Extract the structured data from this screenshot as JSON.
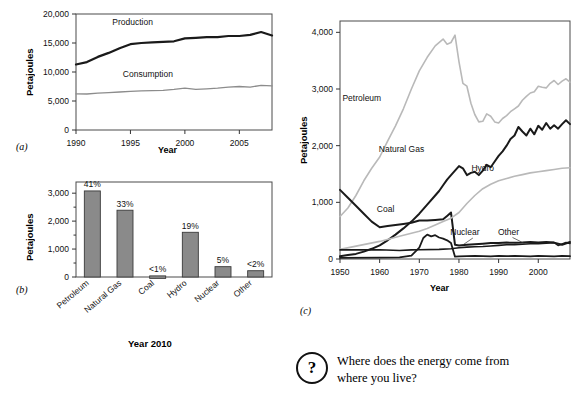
{
  "figure": {
    "panel_a_tag": "(a)",
    "panel_b_tag": "(b)",
    "panel_c_tag": "(c)",
    "bar_caption": "Year 2010",
    "colors": {
      "dark_series": "#1a1a1a",
      "light_series": "#b3b3b3",
      "bar_fill": "#8a8a8a",
      "bar_stroke": "#3a3a3a",
      "frame": "#4a4a4a",
      "text": "#111111"
    }
  },
  "question": {
    "badge": "?",
    "text": "Where does the energy come from where you live?"
  },
  "chart_data": [
    {
      "id": "panel-a",
      "type": "line",
      "title": "",
      "xlabel": "Year",
      "ylabel": "Petajoules",
      "xlim": [
        1990,
        2008
      ],
      "ylim": [
        0,
        20000
      ],
      "xticks": [
        1990,
        1995,
        2000,
        2005
      ],
      "xtick_labels": [
        "1990",
        "1995",
        "2000",
        "2005"
      ],
      "yticks": [
        0,
        5000,
        10000,
        15000,
        20000
      ],
      "ytick_labels": [
        "0",
        "5,000",
        "10,000",
        "15,000",
        "20,000"
      ],
      "grid": false,
      "legend": "inline-annotation",
      "x": [
        1990,
        1991,
        1992,
        1993,
        1994,
        1995,
        1996,
        1997,
        1998,
        1999,
        2000,
        2001,
        2002,
        2003,
        2004,
        2005,
        2006,
        2007,
        2008
      ],
      "series": [
        {
          "name": "Production",
          "color": "#1a1a1a",
          "width": 2.2,
          "label_x": 1995.2,
          "label_y": 18100,
          "values": [
            11300,
            11700,
            12600,
            13300,
            14100,
            14800,
            15000,
            15100,
            15200,
            15300,
            15800,
            15900,
            16000,
            16000,
            16200,
            16200,
            16400,
            16900,
            16300
          ]
        },
        {
          "name": "Consumption",
          "color": "#8c8c8c",
          "width": 1.3,
          "label_x": 1996.6,
          "label_y": 9100,
          "values": [
            6250,
            6200,
            6350,
            6450,
            6550,
            6650,
            6750,
            6800,
            6850,
            7000,
            7200,
            7000,
            7100,
            7200,
            7400,
            7500,
            7400,
            7700,
            7600
          ]
        }
      ]
    },
    {
      "id": "panel-b",
      "type": "bar",
      "title": "",
      "xlabel": "",
      "ylabel": "Petajoules",
      "ylim": [
        0,
        3400
      ],
      "yticks": [
        0,
        1000,
        2000,
        3000
      ],
      "ytick_labels": [
        "0",
        "1,000",
        "2,000",
        "3,000"
      ],
      "grid": false,
      "categories": [
        "Petroleum",
        "Natural Gas",
        "Coal",
        "Hydro",
        "Nuclear",
        "Other"
      ],
      "values": [
        3080,
        2390,
        40,
        1600,
        370,
        225
      ],
      "data_labels": [
        "41%",
        "33%",
        "<1%",
        "19%",
        "5%",
        "<2%"
      ],
      "caption": "Year 2010"
    },
    {
      "id": "panel-c",
      "type": "line",
      "title": "",
      "xlabel": "Year",
      "ylabel": "Petajoules",
      "xlim": [
        1950,
        2008
      ],
      "ylim": [
        0,
        4200
      ],
      "xticks": [
        1950,
        1960,
        1970,
        1980,
        1990,
        2000
      ],
      "xtick_labels": [
        "1950",
        "1960",
        "1970",
        "1980",
        "1990",
        "2000"
      ],
      "yticks": [
        0,
        1000,
        2000,
        3000,
        4000
      ],
      "ytick_labels": [
        "0",
        "1,000",
        "2,000",
        "3,000",
        "4,000"
      ],
      "grid": false,
      "legend": "inline-annotation",
      "series": [
        {
          "name": "Petroleum",
          "color": "#b9b9b9",
          "width": 1.6,
          "label_x": 1955.5,
          "label_y": 2780,
          "leader": null,
          "x": [
            1950,
            1952,
            1954,
            1956,
            1958,
            1960,
            1962,
            1964,
            1966,
            1968,
            1970,
            1972,
            1974,
            1976,
            1977,
            1978,
            1979,
            1980,
            1981,
            1982,
            1983,
            1984,
            1985,
            1986,
            1987,
            1988,
            1989,
            1990,
            1991,
            1992,
            1993,
            1994,
            1995,
            1996,
            1997,
            1998,
            1999,
            2000,
            2001,
            2002,
            2003,
            2004,
            2005,
            2006,
            2007,
            2008
          ],
          "values": [
            750,
            900,
            1120,
            1380,
            1600,
            1800,
            2080,
            2350,
            2650,
            3000,
            3320,
            3560,
            3760,
            3880,
            3790,
            3820,
            3950,
            3480,
            3100,
            3050,
            2750,
            2550,
            2420,
            2430,
            2560,
            2520,
            2420,
            2400,
            2480,
            2530,
            2600,
            2650,
            2700,
            2800,
            2870,
            2930,
            2950,
            3050,
            3030,
            3020,
            3100,
            3150,
            3080,
            3140,
            3180,
            3120
          ]
        },
        {
          "name": "Natural Gas",
          "color": "#1a1a1a",
          "width": 2.0,
          "label_x": 1965.5,
          "label_y": 1880,
          "leader": null,
          "x": [
            1950,
            1952,
            1954,
            1956,
            1958,
            1960,
            1962,
            1964,
            1966,
            1968,
            1970,
            1972,
            1974,
            1975,
            1976,
            1977,
            1978,
            1979,
            1980,
            1981,
            1982,
            1983,
            1984,
            1985,
            1986,
            1987,
            1988,
            1989,
            1990,
            1991,
            1992,
            1993,
            1994,
            1995,
            1996,
            1997,
            1998,
            1999,
            2000,
            2001,
            2002,
            2003,
            2004,
            2005,
            2006,
            2007,
            2008
          ],
          "values": [
            50,
            70,
            90,
            130,
            180,
            240,
            330,
            430,
            540,
            660,
            800,
            960,
            1120,
            1200,
            1300,
            1400,
            1480,
            1560,
            1640,
            1600,
            1480,
            1520,
            1540,
            1480,
            1560,
            1660,
            1620,
            1720,
            1820,
            1900,
            2000,
            2120,
            2180,
            2330,
            2250,
            2180,
            2300,
            2200,
            2350,
            2280,
            2400,
            2300,
            2360,
            2300,
            2380,
            2450,
            2380
          ]
        },
        {
          "name": "Coal",
          "color": "#1a1a1a",
          "width": 2.0,
          "label_x": 1961.5,
          "label_y": 830,
          "leader": null,
          "x": [
            1950,
            1952,
            1954,
            1956,
            1958,
            1960,
            1962,
            1964,
            1966,
            1968,
            1970,
            1972,
            1974,
            1976,
            1977,
            1978,
            1979,
            1980,
            1982,
            1984,
            1986,
            1988,
            1990,
            1992,
            1994,
            1996,
            1998,
            2000,
            2002,
            2004,
            2006,
            2008
          ],
          "values": [
            1220,
            1080,
            940,
            800,
            660,
            560,
            580,
            600,
            620,
            640,
            680,
            680,
            690,
            700,
            760,
            820,
            250,
            240,
            250,
            260,
            270,
            280,
            280,
            290,
            285,
            290,
            300,
            290,
            300,
            290,
            250,
            300
          ]
        },
        {
          "name": "Hydro",
          "color": "#b9b9b9",
          "width": 1.6,
          "label_x": 1986.0,
          "label_y": 1560,
          "leader": null,
          "x": [
            1950,
            1955,
            1960,
            1965,
            1970,
            1972,
            1974,
            1976,
            1978,
            1980,
            1982,
            1984,
            1986,
            1988,
            1990,
            1992,
            1994,
            1996,
            1998,
            2000,
            2002,
            2004,
            2006,
            2008
          ],
          "values": [
            170,
            240,
            310,
            400,
            490,
            540,
            600,
            660,
            720,
            820,
            980,
            1120,
            1240,
            1320,
            1380,
            1420,
            1460,
            1490,
            1520,
            1540,
            1560,
            1580,
            1600,
            1610
          ]
        },
        {
          "name": "Nuclear",
          "color": "#1a1a1a",
          "width": 1.8,
          "label_x": 1981.5,
          "label_y": 420,
          "leader": [
            [
              1983.5,
              370
            ],
            [
              1981.0,
              250
            ]
          ],
          "x": [
            1950,
            1960,
            1965,
            1968,
            1970,
            1971,
            1972,
            1973,
            1974,
            1975,
            1976,
            1977,
            1978,
            1979,
            1980,
            1982,
            1984,
            1986,
            1988,
            1990,
            1992,
            1994,
            1996,
            1998,
            2000,
            2002,
            2004,
            2006,
            2008
          ],
          "values": [
            20,
            25,
            28,
            60,
            200,
            370,
            430,
            400,
            420,
            380,
            360,
            330,
            280,
            40,
            45,
            50,
            55,
            50,
            45,
            55,
            50,
            55,
            50,
            45,
            55,
            50,
            45,
            55,
            50
          ]
        },
        {
          "name": "Other",
          "color": "#1a1a1a",
          "width": 1.6,
          "label_x": 1992.5,
          "label_y": 430,
          "leader": [
            [
              1993.5,
              380
            ],
            [
              1996.5,
              275
            ]
          ],
          "x": [
            1950,
            1960,
            1965,
            1968,
            1970,
            1975,
            1978,
            1979,
            1980,
            1982,
            1984,
            1986,
            1988,
            1990,
            1992,
            1994,
            1996,
            1998,
            2000,
            2002,
            2004,
            2005,
            2006,
            2007,
            2008
          ],
          "values": [
            160,
            165,
            150,
            160,
            165,
            170,
            180,
            190,
            200,
            210,
            215,
            220,
            230,
            240,
            250,
            255,
            262,
            268,
            272,
            280,
            290,
            240,
            265,
            290,
            275
          ]
        }
      ]
    }
  ]
}
